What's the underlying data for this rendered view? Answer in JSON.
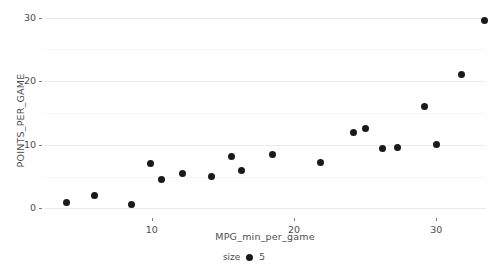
{
  "chart_data": {
    "type": "scatter",
    "title": "",
    "xlabel": "MPG_min_per_game",
    "ylabel": "POINTS_PER_GAME",
    "xlim": [
      2.5,
      33.5
    ],
    "ylim": [
      -1.5,
      31.5
    ],
    "xticks": [
      10,
      20,
      30
    ],
    "yticks": [
      0,
      10,
      20,
      30
    ],
    "xtick_labels": [
      "10",
      "20",
      "30"
    ],
    "ytick_labels": [
      "0",
      "10",
      "20",
      "30"
    ],
    "grid": true,
    "grid_color": "#ebebeb",
    "point_color": "#1a1a1a",
    "point_size": 5,
    "legend": {
      "title": "size",
      "position": "bottom",
      "entries": [
        {
          "label": "5",
          "marker": "filled-circle",
          "color": "#1a1a1a"
        }
      ]
    },
    "points": [
      {
        "x": 4.0,
        "y": 1.0
      },
      {
        "x": 6.0,
        "y": 2.0
      },
      {
        "x": 8.6,
        "y": 0.7
      },
      {
        "x": 9.9,
        "y": 7.0
      },
      {
        "x": 10.7,
        "y": 4.5
      },
      {
        "x": 12.2,
        "y": 5.5
      },
      {
        "x": 14.2,
        "y": 5.0
      },
      {
        "x": 15.6,
        "y": 8.2
      },
      {
        "x": 16.3,
        "y": 6.0
      },
      {
        "x": 18.5,
        "y": 8.5
      },
      {
        "x": 21.9,
        "y": 7.2
      },
      {
        "x": 24.2,
        "y": 12.0
      },
      {
        "x": 25.0,
        "y": 12.6
      },
      {
        "x": 26.2,
        "y": 9.5
      },
      {
        "x": 27.3,
        "y": 9.6
      },
      {
        "x": 29.2,
        "y": 16.0
      },
      {
        "x": 30.0,
        "y": 10.0
      },
      {
        "x": 31.8,
        "y": 21.0
      },
      {
        "x": 33.4,
        "y": 29.5
      }
    ]
  }
}
